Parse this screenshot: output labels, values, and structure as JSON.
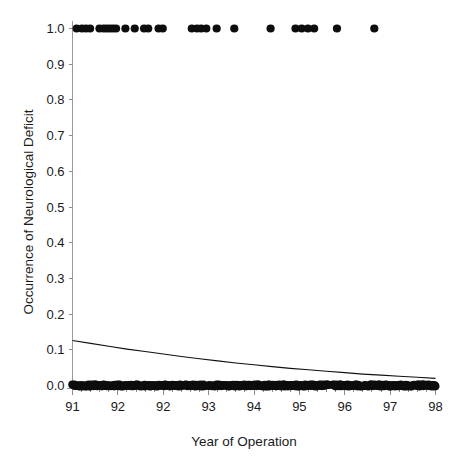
{
  "chart_data": {
    "type": "scatter",
    "title": "",
    "xlabel": "Year of Operation",
    "ylabel": "Occurrence of Neurological Deficit",
    "xlim": [
      91,
      98
    ],
    "ylim": [
      0.0,
      1.0
    ],
    "grid": false,
    "legend": null,
    "x_tick_labels": [
      "91",
      "92",
      "92",
      "93",
      "94",
      "95",
      "96",
      "97",
      "98"
    ],
    "x_tick_values": [
      91,
      91.875,
      92.75,
      93.625,
      94.5,
      95.375,
      96.25,
      97.125,
      98
    ],
    "x_minor_ticks_between_majors": 4,
    "y_tick_labels": [
      "0.0",
      "0.1",
      "0.2",
      "0.3",
      "0.4",
      "0.5",
      "0.6",
      "0.7",
      "0.8",
      "0.9",
      "1.0"
    ],
    "y_tick_values": [
      0.0,
      0.1,
      0.2,
      0.3,
      0.4,
      0.5,
      0.6,
      0.7,
      0.8,
      0.9,
      1.0
    ],
    "series": [
      {
        "name": "Neurological deficit present",
        "y_value": 1.0,
        "marker": "filled-circle",
        "color": "#0d0d0d",
        "x": [
          91.08,
          91.18,
          91.26,
          91.34,
          91.52,
          91.6,
          91.66,
          91.72,
          91.78,
          91.84,
          92.02,
          92.2,
          92.38,
          92.46,
          92.66,
          92.74,
          93.3,
          93.4,
          93.48,
          93.58,
          93.78,
          94.12,
          94.82,
          95.3,
          95.42,
          95.54,
          95.66,
          96.1,
          96.82
        ]
      },
      {
        "name": "No neurological deficit",
        "y_value": 0.0,
        "marker": "filled-circle",
        "color": "#0d0d0d",
        "x_range": [
          91.0,
          98.0
        ],
        "density": "dense-continuous",
        "approx_count": 430,
        "gaps": [
          [
            93.55,
            93.62
          ],
          [
            95.95,
            96.02
          ]
        ]
      }
    ],
    "fit_curve": {
      "name": "Logistic fit",
      "color": "#111111",
      "points": [
        [
          91.0,
          0.126
        ],
        [
          91.35,
          0.118
        ],
        [
          91.7,
          0.11
        ],
        [
          92.05,
          0.102
        ],
        [
          92.4,
          0.095
        ],
        [
          92.75,
          0.088
        ],
        [
          93.1,
          0.081
        ],
        [
          93.45,
          0.075
        ],
        [
          93.8,
          0.069
        ],
        [
          94.15,
          0.063
        ],
        [
          94.5,
          0.058
        ],
        [
          94.85,
          0.053
        ],
        [
          95.2,
          0.048
        ],
        [
          95.55,
          0.044
        ],
        [
          95.9,
          0.04
        ],
        [
          96.25,
          0.036
        ],
        [
          96.6,
          0.032
        ],
        [
          96.95,
          0.029
        ],
        [
          97.3,
          0.026
        ],
        [
          97.65,
          0.023
        ],
        [
          98.0,
          0.02
        ]
      ]
    }
  },
  "colors": {
    "background": "#ffffff",
    "point": "#0d0d0d",
    "curve": "#111111",
    "axis": "#9a9a9a",
    "text": "#1a1a1a"
  }
}
